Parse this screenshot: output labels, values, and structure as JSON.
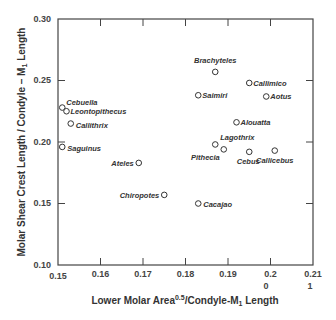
{
  "chart_data": {
    "type": "scatter",
    "title": "",
    "xlabel": "Lower Molar Area^0.5/Condyle-M1 Length",
    "xlabel_parts": {
      "pre": "Lower Molar Area",
      "sup": "0.5",
      "mid": "/Condyle-M",
      "sub": "1",
      "post": " Length"
    },
    "ylabel": "Molar Shear Crest Length / Condyle – M1 Length",
    "ylabel_parts": {
      "pre": "Molar Shear Crest Length / Condyle – M",
      "sub": "1",
      "post": " Length"
    },
    "xlim": [
      0.15,
      0.21
    ],
    "ylim": [
      0.1,
      0.3
    ],
    "xticks": [
      "0.15",
      "0.16",
      "0.17",
      "0.18",
      "0.19",
      "0.2",
      "0.21"
    ],
    "xtick_extra": {
      "0.2": "0",
      "0.21": "1"
    },
    "yticks": [
      "0.10",
      "0.15",
      "0.20",
      "0.25",
      "0.30"
    ],
    "grid": false,
    "legend": null,
    "points": [
      {
        "label": "Cebuella",
        "x": 0.151,
        "y": 0.228
      },
      {
        "label": "Leontopithecus",
        "x": 0.152,
        "y": 0.225
      },
      {
        "label": "Callithrix",
        "x": 0.153,
        "y": 0.215
      },
      {
        "label": "Saguinus",
        "x": 0.151,
        "y": 0.196
      },
      {
        "label": "Ateles",
        "x": 0.169,
        "y": 0.183
      },
      {
        "label": "Chiropotes",
        "x": 0.175,
        "y": 0.157
      },
      {
        "label": "Cacajao",
        "x": 0.183,
        "y": 0.15
      },
      {
        "label": "Brachyteles",
        "x": 0.187,
        "y": 0.257
      },
      {
        "label": "Callimico",
        "x": 0.195,
        "y": 0.248
      },
      {
        "label": "Saimiri",
        "x": 0.183,
        "y": 0.238
      },
      {
        "label": "Aotus",
        "x": 0.199,
        "y": 0.237
      },
      {
        "label": "Alouatta",
        "x": 0.192,
        "y": 0.216
      },
      {
        "label": "Lagothrix",
        "x": 0.187,
        "y": 0.198
      },
      {
        "label": "Pithecia",
        "x": 0.189,
        "y": 0.194
      },
      {
        "label": "Cebus",
        "x": 0.195,
        "y": 0.192
      },
      {
        "label": "Callicebus",
        "x": 0.201,
        "y": 0.193
      }
    ]
  }
}
